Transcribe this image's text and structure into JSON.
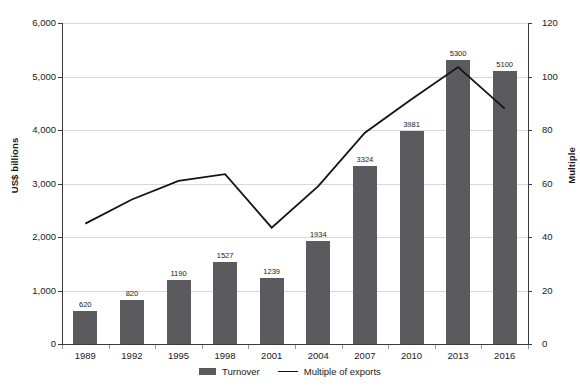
{
  "chart_data": {
    "type": "bar",
    "title": "",
    "subtitle": "",
    "categories": [
      "1989",
      "1992",
      "1995",
      "1998",
      "2001",
      "2004",
      "2007",
      "2010",
      "2013",
      "2016"
    ],
    "xlabel": "",
    "series": [
      {
        "name": "Turnover",
        "type": "bar",
        "axis": "left",
        "color": "#5a5a5f",
        "values": [
          620,
          820,
          1190,
          1527,
          1239,
          1934,
          3324,
          3981,
          5300,
          5100
        ],
        "value_labels": [
          "620",
          "820",
          "1190",
          "1527",
          "1239",
          "1934",
          "3324",
          "3981",
          "5300",
          "5100"
        ]
      },
      {
        "name": "Multiple of exports",
        "type": "line",
        "axis": "right",
        "color": "#141414",
        "values": [
          45,
          54,
          61,
          63.5,
          43.5,
          59,
          79,
          91.5,
          103.5,
          88
        ]
      }
    ],
    "left_axis": {
      "label": "US$ billions",
      "ylim": [
        0,
        6000
      ],
      "ticks": [
        0,
        1000,
        2000,
        3000,
        4000,
        5000,
        6000
      ],
      "tick_labels": [
        "0",
        "1,000",
        "2,000",
        "3,000",
        "4,000",
        "5,000",
        "6,000"
      ]
    },
    "right_axis": {
      "label": "Multiple",
      "ylim": [
        0,
        120
      ],
      "ticks": [
        0,
        20,
        40,
        60,
        80,
        100,
        120
      ],
      "tick_labels": [
        "0",
        "20",
        "40",
        "60",
        "80",
        "100",
        "120"
      ]
    },
    "grid": true,
    "legend": {
      "position": "bottom",
      "entries": [
        {
          "label": "Turnover",
          "marker": "bar"
        },
        {
          "label": "Multiple of exports",
          "marker": "line"
        }
      ]
    }
  }
}
